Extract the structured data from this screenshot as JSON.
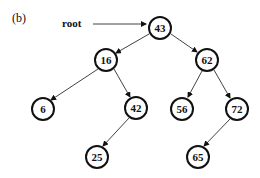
{
  "figure": {
    "panel_label": "(b)",
    "pointer_label": "root",
    "tree_type": "binary search tree"
  },
  "nodes": [
    {
      "id": "n43",
      "value": "43",
      "x": 160,
      "y": 28
    },
    {
      "id": "n16",
      "value": "16",
      "x": 106,
      "y": 60
    },
    {
      "id": "n62",
      "value": "62",
      "x": 207,
      "y": 60
    },
    {
      "id": "n6",
      "value": "6",
      "x": 43,
      "y": 109
    },
    {
      "id": "n42",
      "value": "42",
      "x": 136,
      "y": 108
    },
    {
      "id": "n56",
      "value": "56",
      "x": 182,
      "y": 109
    },
    {
      "id": "n72",
      "value": "72",
      "x": 237,
      "y": 109
    },
    {
      "id": "n25",
      "value": "25",
      "x": 97,
      "y": 157
    },
    {
      "id": "n65",
      "value": "65",
      "x": 198,
      "y": 157
    }
  ],
  "edges": [
    {
      "from": "43",
      "to": "16"
    },
    {
      "from": "43",
      "to": "62"
    },
    {
      "from": "16",
      "to": "6"
    },
    {
      "from": "16",
      "to": "42"
    },
    {
      "from": "62",
      "to": "56"
    },
    {
      "from": "62",
      "to": "72"
    },
    {
      "from": "42",
      "to": "25"
    },
    {
      "from": "72",
      "to": "65"
    }
  ],
  "colors": {
    "stroke": "#111111",
    "background": "#ffffff"
  }
}
